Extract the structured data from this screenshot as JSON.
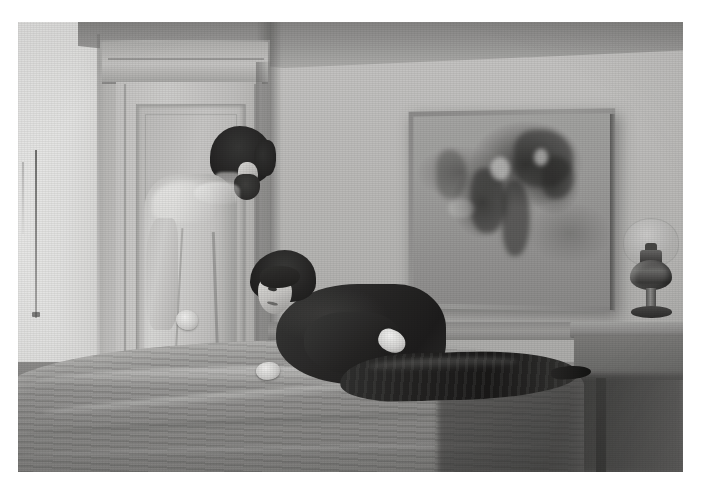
{
  "artwork": {
    "medium_appearance": "monochrome grey-wash painting reproduction",
    "border_color": "#ffffff",
    "plate_background": "#a9a7a2",
    "scene_title": "Interior with a standing man and a reclining woman",
    "caption": ""
  },
  "room": {
    "wall_left_label": "left wall",
    "wall_right_label": "right wall",
    "ceiling_label": "ceiling",
    "floor_label": "floor",
    "baseboard_label": "baseboard",
    "corner_label": "wall corner",
    "colors": {
      "wall_left": "#cfccc5",
      "wall_left_far": "#e2e0da",
      "wall_right": "#bfbcb4",
      "ceiling": "#97948d",
      "floor": "#85827b"
    }
  },
  "door": {
    "label": "panelled door",
    "leaf_label": "door leaf",
    "panel_label": "recessed door panel",
    "lintel_label": "door lintel",
    "color": "#c4c1b9"
  },
  "wall_art": {
    "label": "framed painting on wall",
    "frame_label": "picture frame",
    "canvas_label": "painting canvas",
    "description": "dark gestural abstract marks suggesting figures on a lighter ground",
    "frame_color": "#8f8c85",
    "canvas_color": "#9e9b93"
  },
  "cord": {
    "label": "thin vertical line on far left wall"
  },
  "man": {
    "label": "standing man facing away",
    "posture": "head bowed, hands clasped behind back",
    "hair_label": "dark curly hair",
    "beard_label": "beard",
    "face_label": "profile of face",
    "robe_label": "light coloured robe",
    "hands_label": "clasped hands",
    "robe_color": "#d2cfc7",
    "hair_color": "#2b2925"
  },
  "woman": {
    "label": "reclining woman on bed",
    "posture": "propped on one arm, gaze lowered",
    "hair_label": "short dark bobbed hair",
    "face_label": "face with downcast eyes",
    "dress_label": "dark long sleeved dress",
    "skirt_label": "dark skirt extending across the bed",
    "hand_label": "pale hand resting on bed",
    "shoe_label": "dark shoe",
    "dress_color": "#2c2a26",
    "hair_color": "#2a2824"
  },
  "bed": {
    "label": "bed with draped coverlet",
    "crest_label": "coverlet crest highlight",
    "colors": {
      "coverlet": "#918e86",
      "shadow": "#4f4c46"
    }
  },
  "side_table": {
    "label": "wooden side table",
    "top_label": "table top",
    "leg_label": "table leg",
    "shadow_label": "cast shadow under table",
    "color": "#7d7a73"
  },
  "lamp": {
    "label": "oil lamp",
    "shade_label": "glass globe shade",
    "font_label": "lamp fuel reservoir",
    "burner_label": "burner collar",
    "stem_label": "pedestal stem",
    "base_label": "lamp base",
    "color": "#4d4a44"
  }
}
